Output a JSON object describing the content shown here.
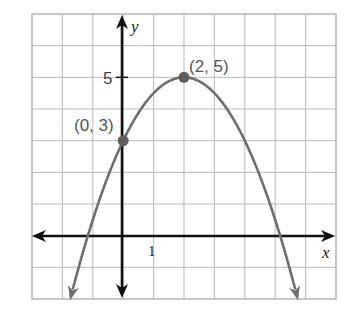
{
  "chart_data": {
    "type": "line",
    "title": "",
    "function": "y = -0.5(x - 2)^2 + 5",
    "xlabel": "x",
    "ylabel": "y",
    "xlim": [
      -3,
      7
    ],
    "ylim": [
      -2,
      7
    ],
    "grid": true,
    "tick_labels": {
      "x": [
        {
          "value": 1,
          "label": "1"
        }
      ],
      "y": [
        {
          "value": 5,
          "label": "5"
        }
      ]
    },
    "series": [
      {
        "name": "parabola",
        "color": "#6e6e6e",
        "x": [
          -1.74,
          -1.16,
          0,
          1,
          2,
          3,
          4,
          5.16,
          5.74
        ],
        "y": [
          -2,
          0,
          3,
          4.5,
          5,
          4.5,
          3,
          0,
          -2
        ]
      }
    ],
    "points": [
      {
        "x": 0,
        "y": 3,
        "label": "(0, 3)"
      },
      {
        "x": 2,
        "y": 5,
        "label": "(2, 5)"
      }
    ],
    "annotations": [
      "(0, 3)",
      "(2, 5)"
    ],
    "legend": null
  },
  "labels": {
    "x_axis": "x",
    "y_axis": "y",
    "x_tick_1": "1",
    "y_tick_5": "5",
    "point_a": "(0, 3)",
    "point_b": "(2, 5)"
  },
  "colors": {
    "grid": "#b9b9b9",
    "axis": "#111111",
    "curve": "#6e6e6e",
    "point": "#5e5e5e",
    "label": "#555555"
  }
}
